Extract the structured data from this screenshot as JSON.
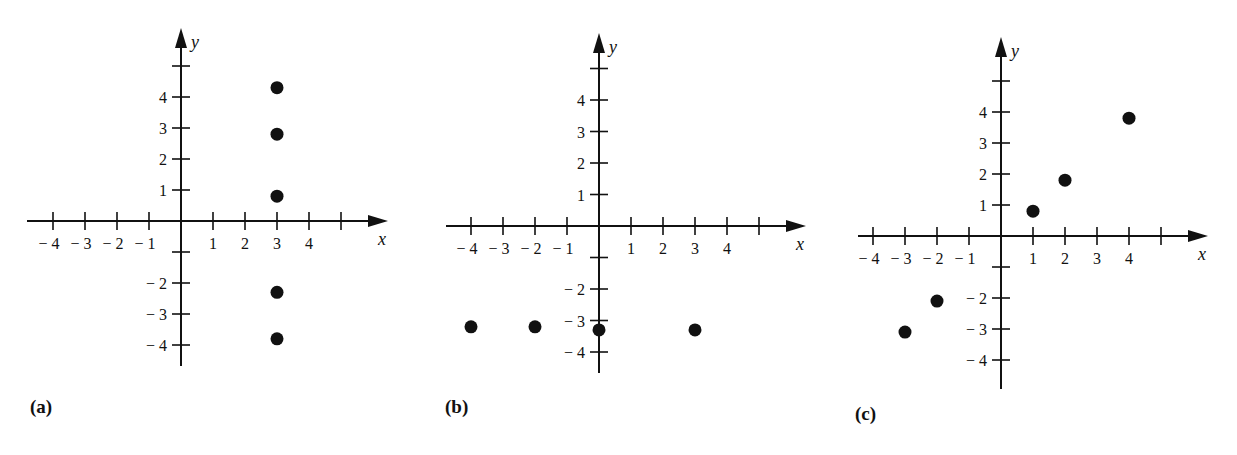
{
  "chart_data": [
    {
      "type": "scatter",
      "panel_label": "(a)",
      "xlabel": "x",
      "ylabel": "y",
      "xlim": [
        -4,
        5
      ],
      "ylim": [
        -4,
        5
      ],
      "x_ticks": [
        -4,
        -3,
        -2,
        -1,
        1,
        2,
        3,
        4
      ],
      "x_tick_labels": [
        "− 4",
        "− 3",
        "− 2",
        "− 1",
        "1",
        "2",
        "3",
        "4"
      ],
      "y_ticks": [
        -4,
        -3,
        -2,
        1,
        2,
        3,
        4
      ],
      "y_tick_labels": [
        "− 4",
        "− 3",
        "− 2",
        "1",
        "2",
        "3",
        "4"
      ],
      "grid": false,
      "points": [
        {
          "x": 3,
          "y": 4.3
        },
        {
          "x": 3,
          "y": 2.8
        },
        {
          "x": 3,
          "y": 0.8
        },
        {
          "x": 3,
          "y": -2.3
        },
        {
          "x": 3,
          "y": -3.8
        }
      ]
    },
    {
      "type": "scatter",
      "panel_label": "(b)",
      "xlabel": "x",
      "ylabel": "y",
      "xlim": [
        -4,
        5
      ],
      "ylim": [
        -4,
        5
      ],
      "x_ticks": [
        -4,
        -3,
        -2,
        -1,
        1,
        2,
        3,
        4
      ],
      "x_tick_labels": [
        "− 4",
        "− 3",
        "− 2",
        "− 1",
        "1",
        "2",
        "3",
        "4"
      ],
      "y_ticks": [
        -4,
        -3,
        -2,
        1,
        2,
        3,
        4
      ],
      "y_tick_labels": [
        "− 4",
        "− 3",
        "− 2",
        "1",
        "2",
        "3",
        "4"
      ],
      "grid": false,
      "points": [
        {
          "x": -4,
          "y": -3.2
        },
        {
          "x": -2,
          "y": -3.2
        },
        {
          "x": 0,
          "y": -3.3
        },
        {
          "x": 3,
          "y": -3.3
        }
      ]
    },
    {
      "type": "scatter",
      "panel_label": "(c)",
      "xlabel": "x",
      "ylabel": "y",
      "xlim": [
        -4,
        5
      ],
      "ylim": [
        -4,
        5
      ],
      "x_ticks": [
        -4,
        -3,
        -2,
        -1,
        1,
        2,
        3,
        4
      ],
      "x_tick_labels": [
        "− 4",
        "− 3",
        "− 2",
        "− 1",
        "1",
        "2",
        "3",
        "4"
      ],
      "y_ticks": [
        -4,
        -3,
        -2,
        1,
        2,
        3,
        4
      ],
      "y_tick_labels": [
        "− 4",
        "− 3",
        "− 2",
        "1",
        "2",
        "3",
        "4"
      ],
      "grid": false,
      "points": [
        {
          "x": -3,
          "y": -3.1
        },
        {
          "x": -2,
          "y": -2.1
        },
        {
          "x": 1,
          "y": 0.8
        },
        {
          "x": 2,
          "y": 1.8
        },
        {
          "x": 4,
          "y": 3.8
        }
      ]
    }
  ],
  "panels_layout": [
    {
      "origin_x": 181,
      "origin_y": 221,
      "unit_x": 32.0,
      "unit_y": 31.0,
      "x_start": 27,
      "x_end": 388,
      "y_top": 28,
      "y_bottom": 366,
      "label_x": 30,
      "label_y": 413
    },
    {
      "origin_x": 599,
      "origin_y": 226,
      "unit_x": 32.0,
      "unit_y": 31.5,
      "x_start": 446,
      "x_end": 806,
      "y_top": 33,
      "y_bottom": 373,
      "label_x": 445,
      "label_y": 413
    },
    {
      "origin_x": 1001,
      "origin_y": 236,
      "unit_x": 32.0,
      "unit_y": 31.0,
      "x_start": 858,
      "x_end": 1208,
      "y_top": 37,
      "y_bottom": 389,
      "label_x": 855,
      "label_y": 420
    }
  ]
}
